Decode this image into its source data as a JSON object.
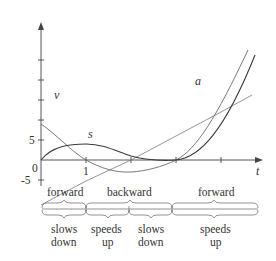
{
  "diagram": {
    "axes": {
      "x_label": "t",
      "origin_label": "0",
      "x_tick_label": "1",
      "y_tick_pos_label": "5",
      "y_tick_neg_label": "-5"
    },
    "curves": [
      {
        "name": "s",
        "label": "s",
        "formula": "t^3 - 6t^2 + 9t"
      },
      {
        "name": "v",
        "label": "v",
        "formula": "3t^2 - 12t + 9"
      },
      {
        "name": "a",
        "label": "a",
        "formula": "6t - 12"
      }
    ],
    "direction_row": {
      "segments": [
        {
          "label": "forward",
          "t_start": 0,
          "t_end": 1
        },
        {
          "label": "backward",
          "t_start": 1,
          "t_end": 3
        },
        {
          "label": "forward",
          "t_start": 3,
          "t_end": 5
        }
      ]
    },
    "speed_row": {
      "segments": [
        {
          "line1": "slows",
          "line2": "down",
          "t_start": 0,
          "t_end": 1
        },
        {
          "line1": "speeds",
          "line2": "up",
          "t_start": 1,
          "t_end": 2
        },
        {
          "line1": "slows",
          "line2": "down",
          "t_start": 2,
          "t_end": 3
        },
        {
          "line1": "speeds",
          "line2": "up",
          "t_start": 3,
          "t_end": 5
        }
      ]
    }
  }
}
